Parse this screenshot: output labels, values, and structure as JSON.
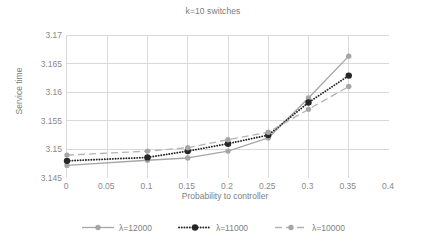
{
  "chart_data": {
    "type": "line",
    "title": "k=10 switches",
    "xlabel": "Probability to controller",
    "ylabel": "Service time",
    "xlim": [
      0,
      0.4
    ],
    "ylim": [
      3.145,
      3.17
    ],
    "xticks": [
      "0",
      "0.05",
      "0.1",
      "0.15",
      "0.2",
      "0.25",
      "0.3",
      "0.35",
      "0.4"
    ],
    "xtick_values": [
      0,
      0.05,
      0.1,
      0.15,
      0.2,
      0.25,
      0.3,
      0.35,
      0.4
    ],
    "yticks": [
      "3.145",
      "3.15",
      "3.155",
      "3.16",
      "3.165",
      "3.17"
    ],
    "ytick_values": [
      3.145,
      3.15,
      3.155,
      3.16,
      3.165,
      3.17
    ],
    "grid": true,
    "legend_position": "bottom",
    "x": [
      0,
      0.1,
      0.15,
      0.2,
      0.25,
      0.3,
      0.35
    ],
    "series": [
      {
        "name": "λ=12000",
        "color": "#a6a6a6",
        "marker_color": "#a6a6a6",
        "line_style": "solid",
        "values": [
          3.1472,
          3.1481,
          3.1485,
          3.1497,
          3.152,
          3.159,
          3.1663
        ]
      },
      {
        "name": "λ=11000",
        "color": "#262626",
        "marker_color": "#262626",
        "line_style": "dotted",
        "values": [
          3.148,
          3.1486,
          3.1497,
          3.151,
          3.1525,
          3.1582,
          3.1629
        ]
      },
      {
        "name": "λ=10000",
        "color": "#b3b3b3",
        "marker_color": "#a6a6a6",
        "line_style": "dashed",
        "values": [
          3.149,
          3.1497,
          3.1503,
          3.1517,
          3.153,
          3.157,
          3.161
        ]
      }
    ]
  },
  "legend": {
    "items": [
      {
        "label": "λ=12000"
      },
      {
        "label": "λ=11000"
      },
      {
        "label": "λ=10000"
      }
    ]
  },
  "colors": {
    "grid": "#d9d9d9",
    "axis": "#d9d9d9",
    "text": "#808080",
    "series_light": "#a6a6a6",
    "series_dark": "#262626"
  }
}
